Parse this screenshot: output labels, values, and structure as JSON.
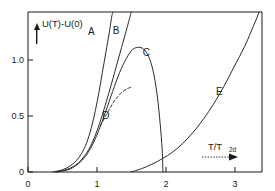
{
  "chart_data": {
    "type": "line",
    "title": "",
    "subtitle": "",
    "xlabel": "T/T_2d",
    "xlabel_main": "T/T",
    "xlabel_sub": "2d",
    "ylabel": "U(T)-U(0)",
    "xlim": [
      0,
      3.4
    ],
    "ylim": [
      0,
      1.45
    ],
    "xticks": [
      0,
      1,
      2,
      3
    ],
    "xticklabels": [
      "0",
      "1",
      "2",
      "3"
    ],
    "yticks": [
      0,
      0.5,
      1.0
    ],
    "yticklabels": [
      "0",
      "0.5",
      "1.0"
    ],
    "grid": false,
    "legend_position": "inline-annotations",
    "annotations": [
      {
        "label": "A",
        "x": 0.92,
        "y": 1.27
      },
      {
        "label": "B",
        "x": 1.28,
        "y": 1.28
      },
      {
        "label": "C",
        "x": 1.72,
        "y": 1.08
      },
      {
        "label": "D",
        "x": 1.13,
        "y": 0.51
      },
      {
        "label": "E",
        "x": 2.78,
        "y": 0.73
      }
    ],
    "series": [
      {
        "name": "A",
        "style": "solid",
        "points": [
          [
            0.36,
            0.0
          ],
          [
            0.5,
            0.02
          ],
          [
            0.6,
            0.05
          ],
          [
            0.7,
            0.1
          ],
          [
            0.78,
            0.17
          ],
          [
            0.85,
            0.26
          ],
          [
            0.92,
            0.4
          ],
          [
            0.98,
            0.56
          ],
          [
            1.03,
            0.72
          ],
          [
            1.08,
            0.9
          ],
          [
            1.13,
            1.08
          ],
          [
            1.18,
            1.26
          ],
          [
            1.22,
            1.42
          ],
          [
            1.24,
            1.45
          ]
        ]
      },
      {
        "name": "B",
        "style": "solid",
        "points": [
          [
            0.4,
            0.0
          ],
          [
            0.55,
            0.02
          ],
          [
            0.66,
            0.05
          ],
          [
            0.76,
            0.1
          ],
          [
            0.86,
            0.18
          ],
          [
            0.95,
            0.29
          ],
          [
            1.04,
            0.44
          ],
          [
            1.12,
            0.6
          ],
          [
            1.2,
            0.77
          ],
          [
            1.28,
            0.95
          ],
          [
            1.36,
            1.13
          ],
          [
            1.44,
            1.31
          ],
          [
            1.5,
            1.45
          ]
        ]
      },
      {
        "name": "C",
        "style": "solid",
        "points": [
          [
            0.42,
            0.0
          ],
          [
            0.58,
            0.02
          ],
          [
            0.7,
            0.06
          ],
          [
            0.82,
            0.13
          ],
          [
            0.93,
            0.24
          ],
          [
            1.03,
            0.38
          ],
          [
            1.13,
            0.55
          ],
          [
            1.23,
            0.73
          ],
          [
            1.33,
            0.9
          ],
          [
            1.43,
            1.03
          ],
          [
            1.52,
            1.11
          ],
          [
            1.62,
            1.13
          ],
          [
            1.7,
            1.1
          ],
          [
            1.77,
            1.02
          ],
          [
            1.83,
            0.88
          ],
          [
            1.88,
            0.68
          ],
          [
            1.92,
            0.44
          ],
          [
            1.95,
            0.2
          ],
          [
            1.96,
            0.0
          ]
        ]
      },
      {
        "name": "D",
        "style": "dashed",
        "points": [
          [
            1.05,
            0.42
          ],
          [
            1.14,
            0.52
          ],
          [
            1.22,
            0.61
          ],
          [
            1.3,
            0.68
          ],
          [
            1.38,
            0.73
          ],
          [
            1.46,
            0.76
          ],
          [
            1.52,
            0.77
          ]
        ]
      },
      {
        "name": "E",
        "style": "solid",
        "points": [
          [
            1.5,
            0.0
          ],
          [
            1.65,
            0.03
          ],
          [
            1.8,
            0.07
          ],
          [
            1.95,
            0.12
          ],
          [
            2.1,
            0.18
          ],
          [
            2.25,
            0.26
          ],
          [
            2.4,
            0.36
          ],
          [
            2.55,
            0.48
          ],
          [
            2.7,
            0.62
          ],
          [
            2.85,
            0.78
          ],
          [
            3.0,
            0.96
          ],
          [
            3.15,
            1.14
          ],
          [
            3.28,
            1.33
          ],
          [
            3.36,
            1.45
          ]
        ]
      }
    ]
  },
  "axes": {
    "y_axis_label": "U(T)-U(0)",
    "y_axis_arrow": "up-arrow-icon",
    "x_axis_arrow": "right-arrow-icon"
  }
}
